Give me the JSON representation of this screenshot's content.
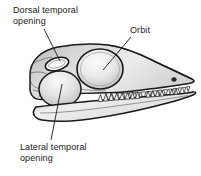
{
  "figure": {
    "background_color": "#ffffff",
    "line_color": "#1a1a1a",
    "bone_fill_light": "#f2f2f2",
    "bone_fill_mid": "#d8d8d8",
    "bone_fill_dark": "#b9b9b9",
    "label_color": "#1a1a1a",
    "font_size_px": 9
  },
  "labels": {
    "dorsal": {
      "line1": "Dorsal temporal",
      "line2": "opening",
      "full": "Dorsal temporal opening"
    },
    "orbit": {
      "line1": "Orbit",
      "full": "Orbit"
    },
    "lateral": {
      "line1": "Lateral temporal",
      "line2": "opening",
      "full": "Lateral temporal opening"
    }
  },
  "anatomy": {
    "dorsal_temporal_opening": "small elongated oval fenestra on skull roof",
    "orbit": "large circular eye socket",
    "lateral_temporal_opening": "large rounded fenestra behind and below orbit",
    "naris": "small dark nostril opening near snout tip",
    "upper_tooth_row": "row of conical teeth on upper jaw",
    "lower_tooth_row": "row of conical teeth on lower jaw",
    "upper_teeth_count": 16,
    "lower_teeth_count": 14
  },
  "leader_lines": {
    "dorsal": "from text down-right to dorsal temporal opening",
    "orbit": "from text down-left to orbit center",
    "lateral": "from lateral temporal opening down to text"
  }
}
